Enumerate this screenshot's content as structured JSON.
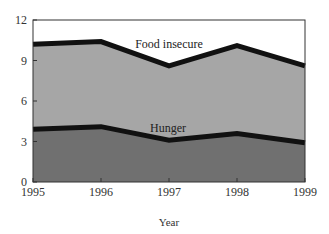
{
  "chart_data": {
    "type": "area",
    "stacked": false,
    "title": "",
    "xlabel": "Year",
    "ylabel": "",
    "x": [
      "1995",
      "1996",
      "1997",
      "1998",
      "1999"
    ],
    "ylim": [
      0,
      12
    ],
    "yticks": [
      0,
      3,
      6,
      9,
      12
    ],
    "grid": false,
    "legend": "inline labels",
    "series": [
      {
        "name": "Food insecure",
        "values": [
          10.2,
          10.4,
          8.6,
          10.1,
          8.6
        ],
        "fill": "#a6a6a6"
      },
      {
        "name": "Hunger",
        "values": [
          3.9,
          4.1,
          3.1,
          3.6,
          2.9
        ],
        "fill": "#707070"
      }
    ],
    "line_color": "#111111"
  },
  "labels": {
    "food_insecure": "Food insecure",
    "hunger": "Hunger",
    "x_axis_title": "Year"
  }
}
